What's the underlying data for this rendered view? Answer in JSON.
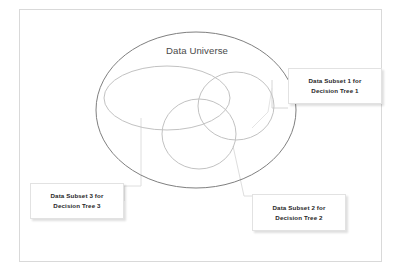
{
  "diagram": {
    "frame": {
      "border_color": "#d9d9d9"
    },
    "universe": {
      "title": "Data Universe",
      "stroke": "#7f7f7f",
      "shape": "ellipse"
    },
    "subsets": [
      {
        "id": "subset-1",
        "shape": "ellipse",
        "stroke": "#bfbfbf",
        "label_line1": "Data Subset 1 for",
        "label_line2": "Decision Tree 1"
      },
      {
        "id": "subset-2",
        "shape": "circle",
        "stroke": "#bfbfbf",
        "label_line1": "Data Subset 2 for",
        "label_line2": "Decision Tree 2"
      },
      {
        "id": "subset-3",
        "shape": "circle",
        "stroke": "#bfbfbf",
        "label_line1": "Data Subset 3 for",
        "label_line2": "Decision Tree 3"
      }
    ],
    "leader_lines": {
      "stroke": "#d6d6d6"
    }
  }
}
